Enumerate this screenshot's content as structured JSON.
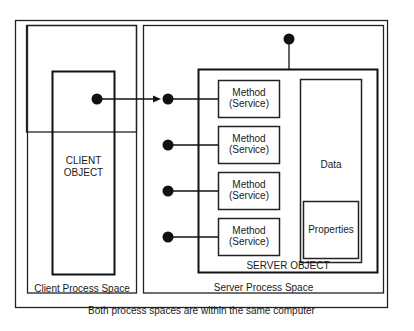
{
  "diagram": {
    "outer_caption": "Both process spaces are within the same computer",
    "client_space_label": "Client Process Space",
    "server_space_label": "Server Process Space",
    "client_object_label": [
      "CLIENT",
      "OBJECT"
    ],
    "server_object_label": "SERVER OBJECT",
    "methods": [
      {
        "line1": "Method",
        "line2": "(Service)"
      },
      {
        "line1": "Method",
        "line2": "(Service)"
      },
      {
        "line1": "Method",
        "line2": "(Service)"
      },
      {
        "line1": "Method",
        "line2": "(Service)"
      }
    ],
    "data_label": "Data",
    "properties_label": "Properties",
    "connection": "Client object calls first method interface (arrow)"
  }
}
